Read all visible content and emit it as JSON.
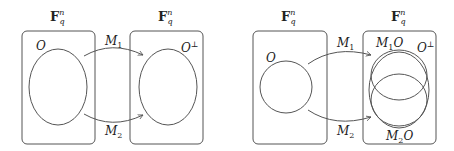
{
  "diagrams": [
    {
      "space_left": {
        "label": "F",
        "sup": "n",
        "sub": "q"
      },
      "space_right": {
        "label": "F",
        "sup": "n",
        "sub": "q"
      },
      "set_left": "O",
      "set_right": "O",
      "set_right_sup": "⊥",
      "map_top": {
        "label": "M",
        "sub": "1"
      },
      "map_bottom": {
        "label": "M",
        "sub": "2"
      }
    },
    {
      "space_left": {
        "label": "F",
        "sup": "n",
        "sub": "q"
      },
      "space_right": {
        "label": "F",
        "sup": "n",
        "sub": "q"
      },
      "set_left": "O",
      "set_right": "O",
      "set_right_sup": "⊥",
      "map_top": {
        "label": "M",
        "sub": "1"
      },
      "map_bottom": {
        "label": "M",
        "sub": "2"
      },
      "image_top": {
        "label": "M",
        "sub": "1",
        "suffix": "O"
      },
      "image_bottom": {
        "label": "M",
        "sub": "2",
        "suffix": "O"
      }
    }
  ],
  "colors": {
    "stroke": "#555555",
    "text": "#222222",
    "background": "#ffffff"
  }
}
